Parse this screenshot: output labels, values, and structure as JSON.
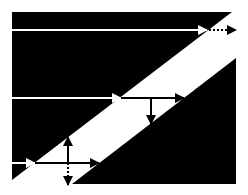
{
  "diagram": {
    "title": "",
    "colors": {
      "background": "#ffffff",
      "region": "#000000",
      "band": "#ffffff",
      "ray_in_region": "#ffffff",
      "ray_in_band": "#000000"
    },
    "regions": [
      {
        "name": "upper-dark-region",
        "points": "12,12 232,12 12,180"
      },
      {
        "name": "lower-dark-region",
        "points": "236,58 236,184 72,184"
      }
    ],
    "rays": [
      {
        "name": "top-ray",
        "incident": {
          "x1": 12,
          "y1": 30,
          "x2": 207,
          "y2": 30
        },
        "transmitted_dotted": {
          "x1": 209,
          "y1": 30,
          "x2": 236,
          "y2": 30
        }
      },
      {
        "name": "middle-ray",
        "incident": {
          "x1": 12,
          "y1": 98,
          "x2": 121,
          "y2": 98
        },
        "transmitted": {
          "x1": 121,
          "y1": 98,
          "x2": 184,
          "y2": 98
        },
        "vertical_down": {
          "x1": 151,
          "y1": 98,
          "x2": 151,
          "y2": 124
        }
      },
      {
        "name": "bottom-ray",
        "incident": {
          "x1": 12,
          "y1": 163,
          "x2": 35,
          "y2": 163
        },
        "transmitted": {
          "x1": 35,
          "y1": 163,
          "x2": 99,
          "y2": 163
        },
        "vertical_up": {
          "x1": 68,
          "y1": 163,
          "x2": 68,
          "y2": 137
        },
        "vertical_down_dotted": {
          "x1": 68,
          "y1": 163,
          "x2": 68,
          "y2": 185
        }
      }
    ]
  }
}
